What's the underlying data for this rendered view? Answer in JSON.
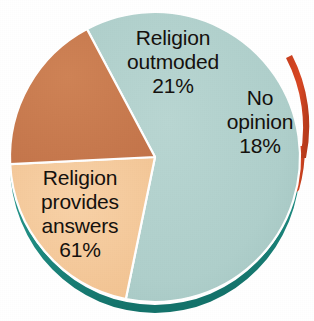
{
  "chart_data": {
    "type": "pie",
    "title": "",
    "subtitle": "",
    "xlabel": "",
    "ylabel": "",
    "legend_position": "none",
    "grid": false,
    "labels_inside_slices": true,
    "categories": [
      "Religion provides answers",
      "Religion outmoded",
      "No opinion"
    ],
    "values": [
      61,
      21,
      18
    ],
    "unit": "%",
    "total": 100,
    "slices": [
      {
        "name": "religion-provides-answers",
        "label_lines": [
          "Religion",
          "provides",
          "answers"
        ],
        "value": 61,
        "value_text": "61%",
        "color": "#afcfcb",
        "edge_color": "#1e8a80"
      },
      {
        "name": "religion-outmoded",
        "label_lines": [
          "Religion",
          "outmoded"
        ],
        "value": 21,
        "value_text": "21%",
        "color": "#f5c99a",
        "edge_color": "#e0a463"
      },
      {
        "name": "no-opinion",
        "label_lines": [
          "No",
          "opinion"
        ],
        "value": 18,
        "value_text": "18%",
        "color": "#c97b4e",
        "edge_color": "#d94824"
      }
    ]
  },
  "colors": {
    "background": "#ffffff",
    "text": "#15110e",
    "teal_slice": "#afcfcb",
    "teal_depth": "#1e8a80",
    "tan_slice": "#f5c99a",
    "terracotta_slice": "#c97b4e",
    "red_rim": "#d94824"
  }
}
